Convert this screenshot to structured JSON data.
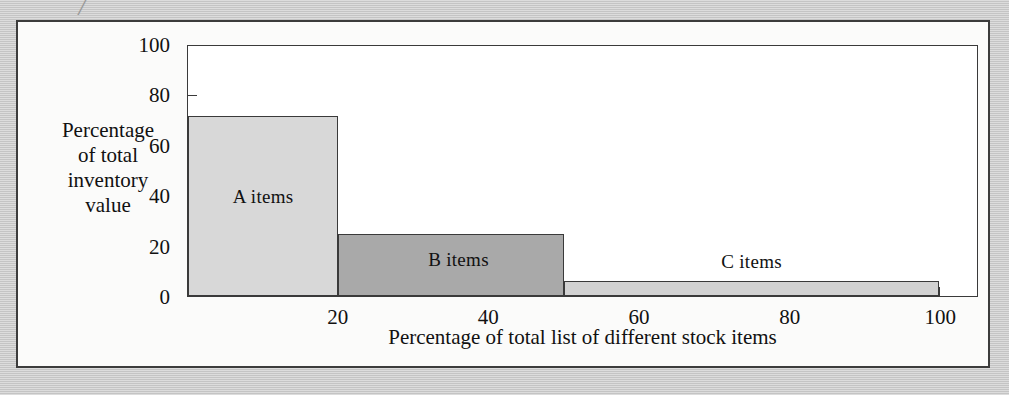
{
  "figure": {
    "background_color": "#c9c9c9",
    "panel_color": "#fbfbfa",
    "border_color": "#3c3c3c",
    "top_artifact_glyph": "╱"
  },
  "chart_data": {
    "type": "bar",
    "title": "",
    "subtitle": "",
    "xlabel": "Percentage of total list of different stock items",
    "ylabel": "Percentage of total inventory value",
    "ylabel_lines": [
      "Percentage",
      "of total",
      "inventory",
      "value"
    ],
    "xlim": [
      0,
      105
    ],
    "ylim": [
      0,
      100
    ],
    "grid": false,
    "legend_position": "none",
    "orientation": "vertical",
    "variable_width_bars": true,
    "x_ticks": [
      20,
      40,
      60,
      80,
      100
    ],
    "x_tick_labels": [
      "20",
      "40",
      "60",
      "80",
      "100"
    ],
    "y_ticks": [
      0,
      20,
      40,
      60,
      80,
      100
    ],
    "y_tick_labels": [
      "0",
      "20",
      "40",
      "60",
      "80",
      "100"
    ],
    "categories": [
      "A items",
      "B items",
      "C items"
    ],
    "values": [
      72,
      25,
      6
    ],
    "bars": [
      {
        "label": "A items",
        "x_start": 0,
        "x_end": 20,
        "value": 72,
        "fill": "#d8d8d8",
        "label_x": 10,
        "label_y": 40
      },
      {
        "label": "B items",
        "x_start": 20,
        "x_end": 50,
        "value": 25,
        "fill": "#a9a9a9",
        "label_x": 36,
        "label_y": 15
      },
      {
        "label": "C items",
        "x_start": 50,
        "x_end": 100,
        "value": 6,
        "fill": "#d2d2d2",
        "label_x": 75,
        "label_y": 14
      }
    ]
  }
}
